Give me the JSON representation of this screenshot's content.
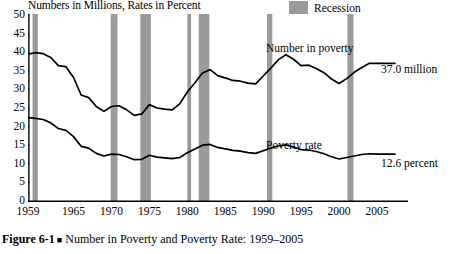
{
  "figure": {
    "axis_title": "Numbers in Millions, Rates in Percent",
    "caption_number": "Figure 6-1",
    "caption_bullet": "■",
    "caption_text": "Number in Poverty and Poverty Rate: 1959–2005"
  },
  "legend": {
    "recession_label": "Recession",
    "recession_color": "#9a9a9a"
  },
  "annotations": {
    "number_in_poverty_label": "Number in poverty",
    "number_in_poverty_value": "37.0 million",
    "poverty_rate_label": "Poverty rate",
    "poverty_rate_value": "12.6 percent"
  },
  "chart_data": {
    "type": "line",
    "title": "Number in Poverty and Poverty Rate: 1959–2005",
    "subtitle": "Numbers in Millions, Rates in Percent",
    "xlabel": "",
    "ylabel": "Numbers in Millions, Rates in Percent",
    "xlim": [
      1959,
      2005
    ],
    "ylim": [
      0,
      50
    ],
    "ytick_values": [
      0,
      5,
      10,
      15,
      20,
      25,
      30,
      35,
      40,
      45,
      50
    ],
    "ytick_labels": [
      "0",
      "5",
      "10",
      "15",
      "20",
      "25",
      "30",
      "35",
      "40",
      "45",
      "50"
    ],
    "xtick_values": [
      1959,
      1965,
      1970,
      1975,
      1980,
      1985,
      1990,
      1995,
      2000,
      2005
    ],
    "xtick_labels": [
      "1959",
      "1965",
      "1970",
      "1975",
      "1980",
      "1985",
      "1990",
      "1995",
      "2000",
      "2005"
    ],
    "xtick_minor_every": 1,
    "grid": false,
    "legend_position": "top-right",
    "line_color": "#000000",
    "x": [
      1959,
      1960,
      1961,
      1962,
      1963,
      1964,
      1965,
      1966,
      1967,
      1968,
      1969,
      1970,
      1971,
      1972,
      1973,
      1974,
      1975,
      1976,
      1977,
      1978,
      1979,
      1980,
      1981,
      1982,
      1983,
      1984,
      1985,
      1986,
      1987,
      1988,
      1989,
      1990,
      1991,
      1992,
      1993,
      1994,
      1995,
      1996,
      1997,
      1998,
      1999,
      2000,
      2001,
      2002,
      2003,
      2004,
      2005
    ],
    "series": [
      {
        "name": "Number in poverty",
        "units": "millions",
        "end_value": 37.0,
        "end_label": "37.0 million",
        "values": [
          39.5,
          39.9,
          39.6,
          38.6,
          36.4,
          36.1,
          33.2,
          28.5,
          27.8,
          25.4,
          24.1,
          25.4,
          25.6,
          24.5,
          23.0,
          23.4,
          25.9,
          25.0,
          24.7,
          24.5,
          26.1,
          29.3,
          31.8,
          34.4,
          35.3,
          33.7,
          33.1,
          32.4,
          32.2,
          31.7,
          31.5,
          33.6,
          35.7,
          38.0,
          39.3,
          38.1,
          36.4,
          36.5,
          35.6,
          34.5,
          32.8,
          31.6,
          32.9,
          34.6,
          35.9,
          37.0,
          37.0
        ]
      },
      {
        "name": "Poverty rate",
        "units": "percent",
        "end_value": 12.6,
        "end_label": "12.6 percent",
        "values": [
          22.4,
          22.2,
          21.9,
          21.0,
          19.5,
          19.0,
          17.3,
          14.7,
          14.2,
          12.8,
          12.1,
          12.6,
          12.5,
          11.9,
          11.1,
          11.2,
          12.3,
          11.8,
          11.6,
          11.4,
          11.7,
          13.0,
          14.0,
          15.0,
          15.2,
          14.4,
          14.0,
          13.6,
          13.4,
          13.0,
          12.8,
          13.5,
          14.2,
          14.8,
          15.1,
          14.5,
          13.8,
          13.7,
          13.3,
          12.7,
          11.9,
          11.3,
          11.7,
          12.1,
          12.5,
          12.7,
          12.6
        ]
      }
    ],
    "recession_bands": [
      {
        "start": 1959.6,
        "end": 1960.3
      },
      {
        "start": 1969.9,
        "end": 1970.8
      },
      {
        "start": 1973.8,
        "end": 1975.2
      },
      {
        "start": 1980.0,
        "end": 1980.5
      },
      {
        "start": 1981.5,
        "end": 1982.9
      },
      {
        "start": 1990.5,
        "end": 1991.2
      },
      {
        "start": 2001.1,
        "end": 2001.9
      }
    ]
  }
}
